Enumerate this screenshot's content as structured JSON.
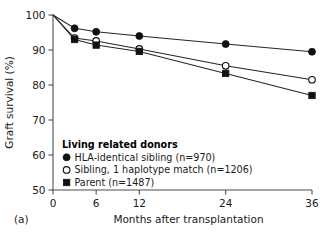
{
  "panel": {
    "label": "(a)"
  },
  "chart_data": {
    "type": "line",
    "title": "",
    "xlabel": "Months after transplantation",
    "ylabel": "Graft survival (%)",
    "xlim": [
      0,
      36
    ],
    "ylim": [
      50,
      100
    ],
    "xticks": [
      0,
      6,
      12,
      24,
      36
    ],
    "xtick_labels": [
      "0",
      "6",
      "12",
      "24",
      "36"
    ],
    "yticks": [
      50,
      60,
      70,
      80,
      90,
      100
    ],
    "ytick_labels": [
      "50",
      "60",
      "70",
      "80",
      "90",
      "100"
    ],
    "grid": false,
    "legend_position": "inside-lower-left",
    "legend_title": "Living related donors",
    "x": [
      0,
      3,
      6,
      12,
      24,
      36
    ],
    "series": [
      {
        "name": "HLA-identical sibling (n=970)",
        "marker": "filled-circle",
        "n": 970,
        "values": [
          100,
          96.2,
          95.2,
          94.0,
          91.7,
          89.5
        ]
      },
      {
        "name": "Sibling, 1 haplotype match (n=1206)",
        "marker": "open-circle",
        "n": 1206,
        "values": [
          100,
          93.4,
          92.6,
          90.3,
          85.5,
          81.5
        ]
      },
      {
        "name": "Parent (n=1487)",
        "marker": "filled-square",
        "n": 1487,
        "values": [
          100,
          93.0,
          91.4,
          89.6,
          83.3,
          77.0
        ]
      }
    ],
    "colors": {
      "line": "#262626",
      "marker_fill": "#111111",
      "marker_open_fill": "#ffffff",
      "axis": "#4d4d4d"
    }
  }
}
